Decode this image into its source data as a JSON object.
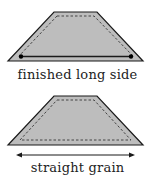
{
  "diagrams": [
    {
      "caption": "finished long side",
      "marker": "finished-edge-line-with-dots"
    },
    {
      "caption": "straight grain",
      "marker": "double-headed-arrow"
    }
  ],
  "colors": {
    "fill": "#bdbdbd",
    "stroke": "#1a1a1a",
    "text": "#222222"
  }
}
